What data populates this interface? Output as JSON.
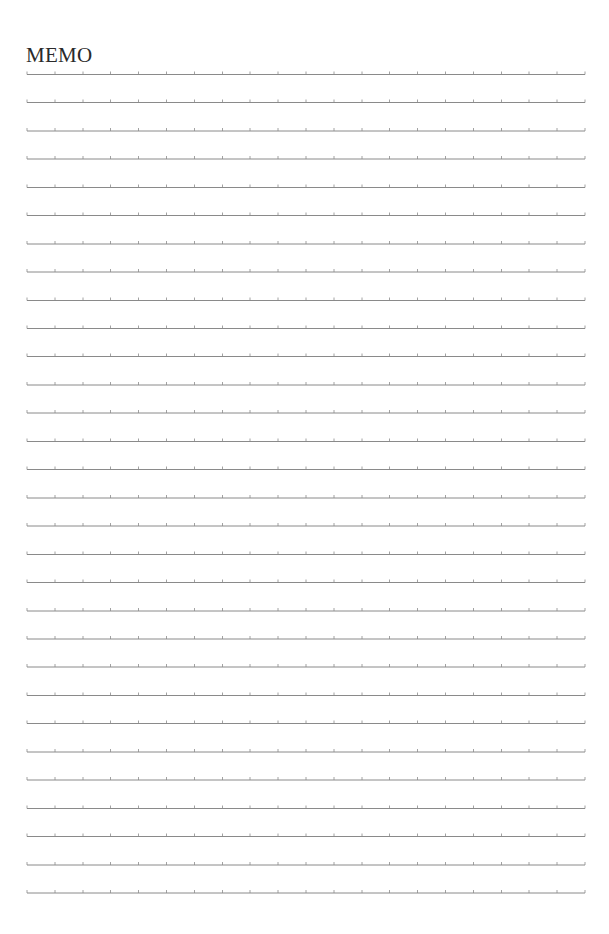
{
  "page": {
    "title": "MEMO"
  },
  "ruling": {
    "line_count": 30,
    "tick_count": 21,
    "line_color": "#8a8a8a",
    "tick_color": "#8a8a8a"
  }
}
